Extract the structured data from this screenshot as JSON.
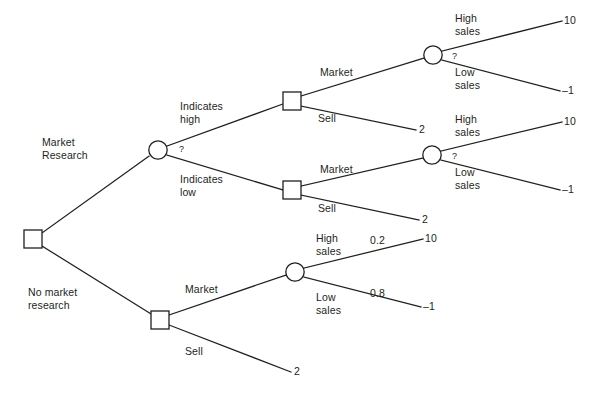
{
  "diagram": {
    "type": "decision-tree",
    "stroke_color": "#231f20",
    "background_color": "#ffffff",
    "nodes": [
      {
        "id": "root",
        "kind": "decision",
        "shape": "square",
        "x": 33,
        "y": 239
      },
      {
        "id": "research-outcome",
        "kind": "chance",
        "shape": "circle",
        "x": 158,
        "y": 150,
        "label": "?"
      },
      {
        "id": "decide-high",
        "kind": "decision",
        "shape": "square",
        "x": 292,
        "y": 101
      },
      {
        "id": "decide-low",
        "kind": "decision",
        "shape": "square",
        "x": 292,
        "y": 190
      },
      {
        "id": "sales-high-branch",
        "kind": "chance",
        "shape": "circle",
        "x": 433,
        "y": 55,
        "label": "?"
      },
      {
        "id": "sales-low-branch",
        "kind": "chance",
        "shape": "circle",
        "x": 432,
        "y": 155,
        "label": "?"
      },
      {
        "id": "decide-noresearch",
        "kind": "decision",
        "shape": "square",
        "x": 160,
        "y": 320
      },
      {
        "id": "sales-noresearch",
        "kind": "chance",
        "shape": "circle",
        "x": 295,
        "y": 272
      }
    ],
    "branch_labels": {
      "market_research": "Market\nResearch",
      "no_market_research": "No market\nresearch",
      "indicates_high": "Indicates\nhigh",
      "indicates_low": "Indicates\nlow",
      "market_upper": "Market",
      "sell_upper": "Sell",
      "market_lower": "Market",
      "sell_lower": "Sell",
      "market_noresearch": "Market",
      "sell_noresearch": "Sell",
      "high_sales_1": "High\nsales",
      "low_sales_1": "Low\nsales",
      "high_sales_2": "High\nsales",
      "low_sales_2": "Low\nsales",
      "high_sales_3": "High\nsales",
      "low_sales_3": "Low\nsales"
    },
    "chance_markers": {
      "research_outcome": "?",
      "sales_high_branch": "?",
      "sales_low_branch": "?"
    },
    "probabilities": {
      "high_sales_noresearch": "0.2",
      "low_sales_noresearch": "0.8"
    },
    "payoffs": {
      "high_sales_1": "10",
      "low_sales_1": "–1",
      "sell_upper": "2",
      "high_sales_2": "10",
      "low_sales_2": "–1",
      "sell_lower": "2",
      "high_sales_3": "10",
      "low_sales_3": "–1",
      "sell_noresearch": "2"
    }
  }
}
